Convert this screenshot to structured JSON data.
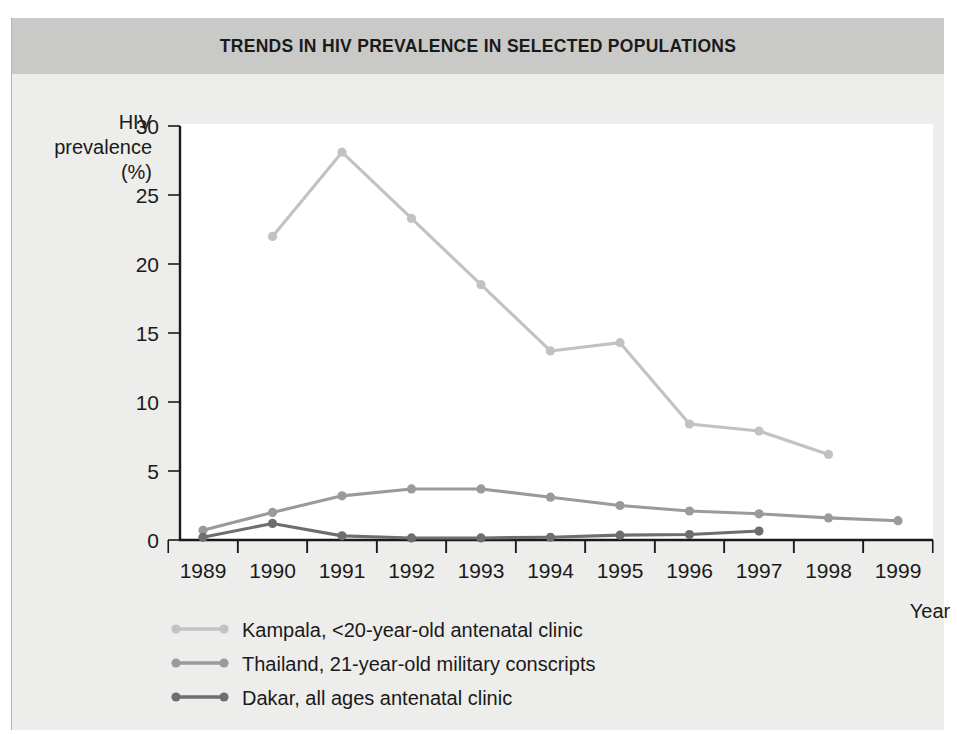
{
  "figure": {
    "title": "TRENDS IN HIV PREVALENCE IN SELECTED POPULATIONS",
    "title_band_color": "#c9c9c7",
    "panel_color": "#ededeb",
    "plot_bg_color": "#ffffff"
  },
  "axes": {
    "y_caption_line1": "HIV",
    "y_caption_line2": "prevalence",
    "y_caption_line3": "(%)",
    "x_caption": "Year",
    "y_ticks": [
      "0",
      "5",
      "10",
      "15",
      "20",
      "25",
      "30"
    ],
    "x_ticks": [
      "1989",
      "1990",
      "1991",
      "1992",
      "1993",
      "1994",
      "1995",
      "1996",
      "1997",
      "1998",
      "1999"
    ]
  },
  "chart_data": {
    "type": "line",
    "title": "TRENDS IN HIV PREVALENCE IN SELECTED POPULATIONS",
    "xlabel": "Year",
    "ylabel": "HIV prevalence (%)",
    "x": [
      1989,
      1990,
      1991,
      1992,
      1993,
      1994,
      1995,
      1996,
      1997,
      1998,
      1999
    ],
    "xlim": [
      1989,
      1999
    ],
    "ylim": [
      0,
      30
    ],
    "ytick_step": 5,
    "grid": false,
    "legend_position": "below-left",
    "series": [
      {
        "name": "Kampala, <20-year-old antenatal clinic",
        "color": "#c2c2c2",
        "x": [
          1990,
          1991,
          1992,
          1993,
          1994,
          1995,
          1996,
          1997,
          1998
        ],
        "values": [
          22.0,
          28.1,
          23.3,
          18.5,
          13.7,
          14.3,
          8.4,
          7.9,
          6.2
        ]
      },
      {
        "name": "Thailand, 21-year-old military conscripts",
        "color": "#9a9a9a",
        "x": [
          1989,
          1990,
          1991,
          1992,
          1993,
          1994,
          1995,
          1996,
          1997,
          1998,
          1999
        ],
        "values": [
          0.7,
          2.0,
          3.2,
          3.7,
          3.7,
          3.1,
          2.5,
          2.1,
          1.9,
          1.6,
          1.4
        ]
      },
      {
        "name": "Dakar, all ages antenatal clinic",
        "color": "#6e6e6e",
        "x": [
          1989,
          1990,
          1991,
          1992,
          1993,
          1994,
          1995,
          1996,
          1997
        ],
        "values": [
          0.2,
          1.2,
          0.3,
          0.15,
          0.15,
          0.2,
          0.35,
          0.4,
          0.65
        ]
      }
    ]
  },
  "legend": [
    {
      "label": "Kampala, <20-year-old antenatal clinic",
      "color": "#c2c2c2"
    },
    {
      "label": "Thailand, 21-year-old military conscripts",
      "color": "#9a9a9a"
    },
    {
      "label": "Dakar, all ages antenatal clinic",
      "color": "#6e6e6e"
    }
  ]
}
